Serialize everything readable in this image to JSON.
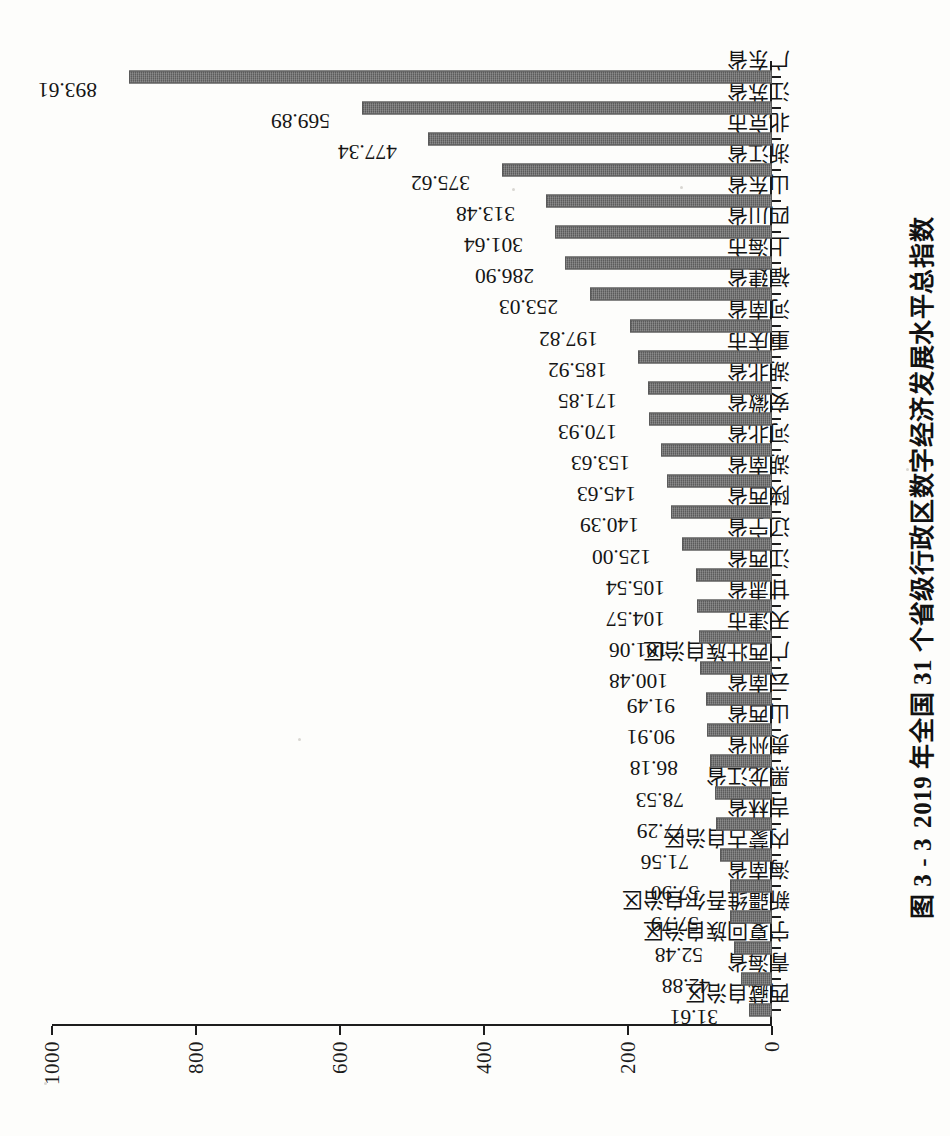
{
  "caption": {
    "number": "图 3 - 3",
    "text": "2019 年全国 31 个省级行政区数字经济发展水平总指数"
  },
  "chart_data": {
    "type": "bar",
    "xlabel": "",
    "ylabel": "",
    "ylim": [
      0,
      1000
    ],
    "yticks": [
      "0",
      "200",
      "400",
      "600",
      "800",
      "1000"
    ],
    "grid": false,
    "legend": null,
    "orientation": "vertical-bars-on-rotated-page",
    "bar_color": "#6d6d6d",
    "categories": [
      "西藏自治区",
      "青海省",
      "宁夏回族自治区",
      "新疆维吾尔自治区",
      "海南省",
      "内蒙古自治区",
      "吉林省",
      "黑龙江省",
      "贵州省",
      "山西省",
      "云南省",
      "广西壮族自治区",
      "天津市",
      "甘肃省",
      "江西省",
      "辽宁省",
      "陕西省",
      "湖南省",
      "河北省",
      "安徽省",
      "湖北省",
      "重庆市",
      "河南省",
      "福建省",
      "上海市",
      "四川省",
      "山东省",
      "浙江省",
      "北京市",
      "江苏省",
      "广东省"
    ],
    "values": [
      31.61,
      42.88,
      52.48,
      57.79,
      57.9,
      71.56,
      77.29,
      78.53,
      86.18,
      90.91,
      91.49,
      100.48,
      101.06,
      104.57,
      105.54,
      125.0,
      140.39,
      145.63,
      153.63,
      170.93,
      171.85,
      185.92,
      197.82,
      253.03,
      286.9,
      301.64,
      313.48,
      375.62,
      477.34,
      569.89,
      893.61
    ],
    "value_labels": [
      "31.61",
      "42.88",
      "52.48",
      "57.79",
      "57.90",
      "71.56",
      "77.29",
      "78.53",
      "86.18",
      "90.91",
      "91.49",
      "100.48",
      "101.06",
      "104.57",
      "105.54",
      "125.00",
      "140.39",
      "145.63",
      "153.63",
      "170.93",
      "171.85",
      "185.92",
      "197.82",
      "253.03",
      "286.90",
      "301.64",
      "313.48",
      "375.62",
      "477.34",
      "569.89",
      "893.61"
    ]
  }
}
